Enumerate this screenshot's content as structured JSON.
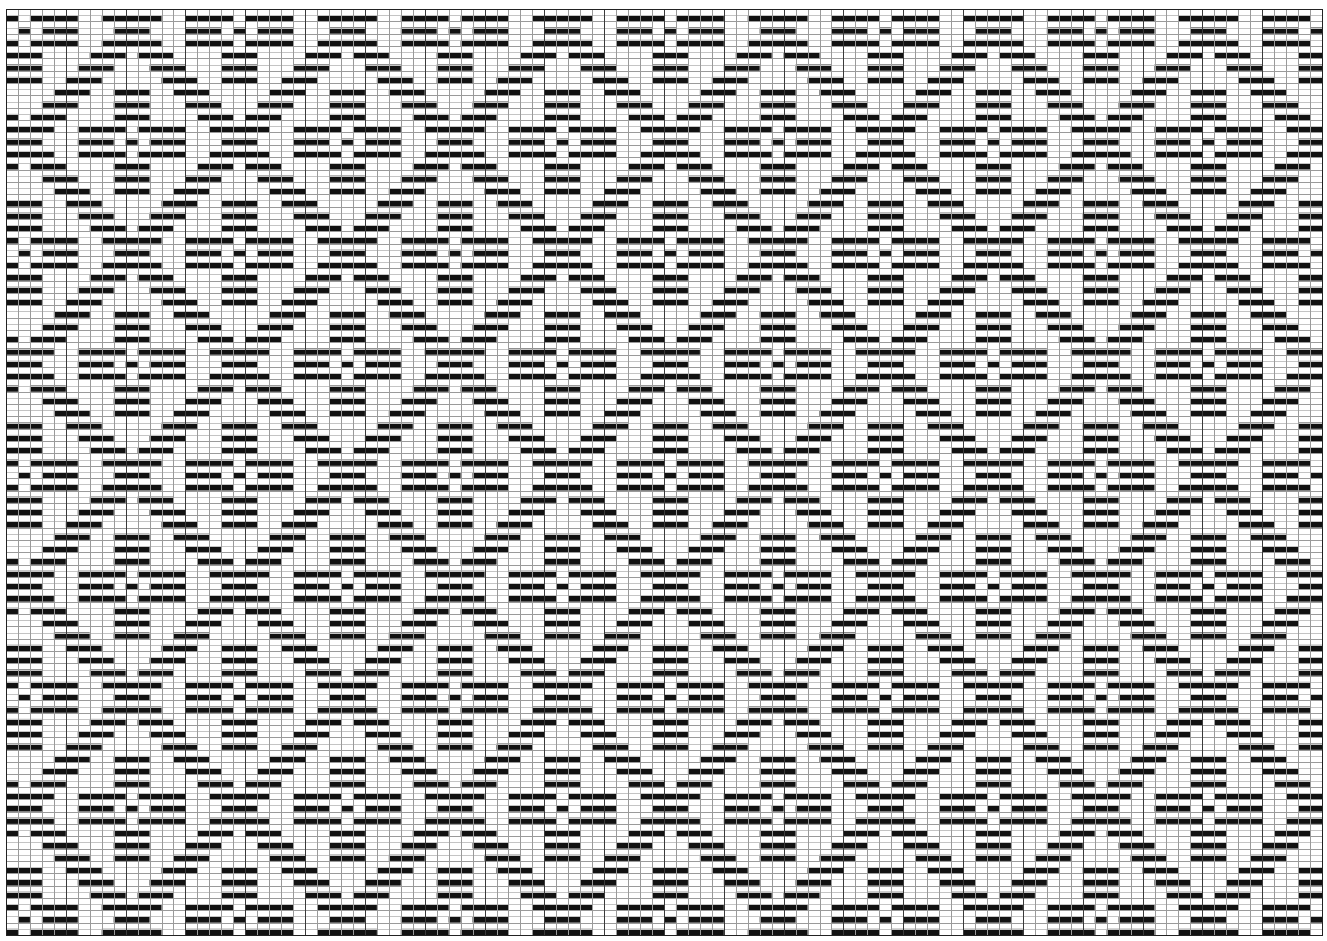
{
  "title": "Weaving draft pattern grid",
  "canvas": {
    "width": 1327,
    "height": 941,
    "background": "#ffffff"
  },
  "grid": {
    "left": 6,
    "top": 9,
    "right": 1322,
    "bottom": 935,
    "columns": 110,
    "rows": 75,
    "half_row_lines": true,
    "major_column_every": 5,
    "colors": {
      "cell_fill": "#111111",
      "minor_line": "#9a9a9a",
      "half_line": "#c4c4c4",
      "major_line": "#3a3a3a",
      "frame": "#222222"
    }
  },
  "pattern": {
    "tile_size": 18,
    "fill_half": "bottom",
    "tile_rows": [
      [
        [
          0,
          0
        ],
        [
          2,
          5
        ],
        [
          8,
          12
        ],
        [
          15,
          17
        ]
      ],
      [
        [
          1,
          1
        ],
        [
          3,
          5
        ],
        [
          9,
          11
        ],
        [
          15,
          17
        ]
      ],
      [
        [
          0,
          0
        ],
        [
          2,
          5
        ],
        [
          8,
          12
        ],
        [
          15,
          17
        ]
      ],
      [
        [
          0,
          2
        ],
        [
          7,
          9
        ],
        [
          11,
          13
        ]
      ],
      [
        [
          0,
          2
        ],
        [
          6,
          8
        ],
        [
          12,
          14
        ]
      ],
      [
        [
          0,
          2
        ],
        [
          5,
          7
        ],
        [
          13,
          15
        ]
      ],
      [
        [
          4,
          6
        ],
        [
          9,
          11
        ],
        [
          14,
          16
        ]
      ],
      [
        [
          3,
          5
        ],
        [
          9,
          11
        ],
        [
          15,
          17
        ]
      ],
      [
        [
          0,
          0
        ],
        [
          2,
          4
        ],
        [
          9,
          11
        ],
        [
          16,
          17
        ]
      ],
      [
        [
          0,
          3
        ],
        [
          6,
          9
        ],
        [
          11,
          14
        ],
        [
          17,
          17
        ]
      ],
      [
        [
          0,
          2
        ],
        [
          6,
          8
        ],
        [
          10,
          10
        ],
        [
          12,
          14
        ]
      ],
      [
        [
          0,
          3
        ],
        [
          6,
          9
        ],
        [
          11,
          14
        ],
        [
          17,
          17
        ]
      ],
      [
        [
          0,
          0
        ],
        [
          2,
          4
        ],
        [
          9,
          11
        ],
        [
          16,
          17
        ]
      ],
      [
        [
          3,
          5
        ],
        [
          9,
          11
        ],
        [
          15,
          17
        ]
      ],
      [
        [
          4,
          6
        ],
        [
          9,
          11
        ],
        [
          14,
          16
        ]
      ],
      [
        [
          0,
          2
        ],
        [
          5,
          7
        ],
        [
          13,
          15
        ]
      ],
      [
        [
          0,
          2
        ],
        [
          6,
          8
        ],
        [
          12,
          14
        ]
      ],
      [
        [
          0,
          2
        ],
        [
          7,
          9
        ],
        [
          11,
          13
        ]
      ]
    ]
  }
}
